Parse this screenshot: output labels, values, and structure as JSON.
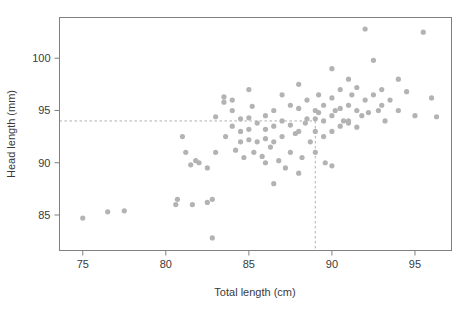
{
  "chart_data": {
    "type": "scatter",
    "title": "",
    "xlabel": "Total length (cm)",
    "ylabel": "Head length (mm)",
    "xlim": [
      73.6,
      97.2
    ],
    "ylim": [
      81.6,
      103.9
    ],
    "xticks": [
      75,
      80,
      85,
      90,
      95
    ],
    "yticks": [
      85,
      90,
      95,
      100
    ],
    "grid": false,
    "legend": null,
    "point_color": "#b3b3b3",
    "point_radius": 2.6,
    "frame_color": "#808080",
    "annotations": {
      "reference_lines": [
        {
          "orientation": "horizontal",
          "value": 94.0,
          "style": "dashed",
          "color": "#b0b0b0"
        },
        {
          "orientation": "vertical",
          "value": 89.0,
          "style": "dashed",
          "color": "#b0b0b0",
          "extent_top": 94.0
        }
      ]
    },
    "x": [
      75.0,
      76.5,
      77.5,
      80.6,
      80.7,
      81.0,
      81.2,
      81.5,
      81.6,
      81.8,
      82.0,
      82.5,
      82.5,
      82.8,
      83.0,
      83.0,
      83.5,
      83.5,
      83.6,
      84.0,
      84.0,
      84.0,
      84.2,
      84.5,
      84.5,
      84.5,
      84.7,
      85.0,
      85.0,
      85.0,
      85.0,
      85.2,
      85.3,
      85.5,
      85.5,
      85.8,
      86.0,
      86.0,
      86.0,
      86.0,
      86.3,
      86.5,
      86.5,
      86.5,
      86.8,
      87.0,
      87.0,
      87.0,
      87.2,
      87.5,
      87.5,
      87.5,
      87.8,
      88.0,
      88.0,
      88.0,
      88.2,
      88.4,
      88.5,
      88.5,
      88.7,
      89.0,
      89.0,
      89.0,
      89.0,
      89.2,
      89.2,
      89.5,
      89.5,
      89.5,
      89.6,
      90.0,
      90.0,
      90.0,
      90.0,
      90.2,
      90.5,
      90.5,
      90.5,
      90.7,
      91.0,
      91.0,
      91.0,
      91.2,
      91.5,
      91.5,
      91.5,
      91.8,
      92.0,
      92.0,
      92.2,
      92.5,
      92.5,
      92.8,
      93.0,
      93.0,
      93.2,
      93.5,
      94.0,
      94.0,
      94.5,
      95.0,
      95.5,
      96.0,
      96.3,
      82.8,
      86.5,
      88.0,
      90.0,
      91.0
    ],
    "y": [
      84.7,
      85.3,
      85.4,
      86.0,
      86.5,
      92.5,
      91.0,
      89.8,
      86.0,
      90.2,
      90.0,
      89.5,
      86.2,
      82.8,
      94.4,
      91.0,
      96.3,
      95.8,
      92.5,
      96.0,
      95.0,
      93.5,
      91.2,
      94.2,
      93.0,
      92.0,
      90.5,
      97.0,
      94.3,
      93.2,
      92.2,
      95.4,
      91.0,
      93.8,
      92.0,
      90.6,
      94.5,
      93.2,
      92.3,
      90.0,
      91.5,
      95.0,
      93.5,
      92.0,
      90.2,
      96.5,
      94.0,
      92.5,
      89.5,
      95.5,
      93.6,
      91.0,
      92.8,
      97.5,
      95.2,
      93.0,
      90.5,
      93.8,
      96.0,
      94.2,
      92.0,
      95.0,
      94.2,
      93.0,
      91.0,
      96.5,
      94.8,
      95.5,
      94.0,
      92.5,
      90.0,
      99.0,
      96.2,
      94.5,
      93.0,
      95.0,
      97.0,
      95.2,
      93.5,
      94.0,
      98.0,
      95.5,
      93.8,
      96.5,
      97.2,
      95.0,
      93.4,
      94.5,
      102.8,
      96.0,
      94.8,
      99.8,
      96.5,
      95.0,
      97.0,
      95.5,
      94.0,
      96.0,
      98.0,
      95.0,
      96.8,
      94.5,
      102.5,
      96.2,
      94.4,
      86.5,
      88.0,
      89.0,
      89.7,
      94.0
    ]
  }
}
